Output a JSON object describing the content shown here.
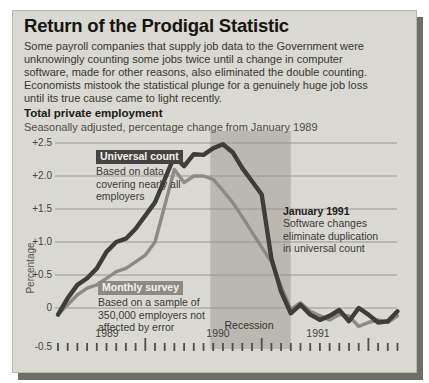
{
  "header": {
    "title": "Return of the Prodigal Statistic",
    "description": "Some payroll companies that supply job data to the Government were unknowingly counting some jobs twice until a change in computer software, made for other reasons, also eliminated the double counting. Economists mistook the statistical plunge for a genuinely huge job loss until its true cause came to light recently.",
    "chart_title": "Total private employment",
    "chart_subtitle": "Seasonally adjusted, percentage change from January 1989"
  },
  "chart_data": {
    "type": "line",
    "title": "Total private employment",
    "subtitle": "Seasonally adjusted, percentage change from January 1989",
    "ylabel": "Percentage",
    "ylim": [
      -0.5,
      2.5
    ],
    "ytick_labels": [
      "+2.5",
      "+2.0",
      "+1.5",
      "+1.0",
      "+0.5",
      "0",
      "-0.5"
    ],
    "ytick_values": [
      2.5,
      2.0,
      1.5,
      1.0,
      0.5,
      0,
      -0.5
    ],
    "grid": "horizontal only",
    "x_interval": "monthly",
    "x_years": [
      "1989",
      "1990",
      "1991"
    ],
    "months": [
      "Jan 1989",
      "Feb 1989",
      "Mar 1989",
      "Apr 1989",
      "May 1989",
      "Jun 1989",
      "Jul 1989",
      "Aug 1989",
      "Sep 1989",
      "Oct 1989",
      "Nov 1989",
      "Dec 1989",
      "Jan 1990",
      "Feb 1990",
      "Mar 1990",
      "Apr 1990",
      "May 1990",
      "Jun 1990",
      "Jul 1990",
      "Aug 1990",
      "Sep 1990",
      "Oct 1990",
      "Nov 1990",
      "Dec 1990",
      "Jan 1991",
      "Feb 1991",
      "Mar 1991",
      "Apr 1991",
      "May 1991",
      "Jun 1991",
      "Jul 1991",
      "Aug 1991",
      "Sep 1991",
      "Oct 1991",
      "Nov 1991",
      "Dec 1991"
    ],
    "tall_tick_indices": [
      9,
      21,
      32
    ],
    "series": [
      {
        "name": "Universal count",
        "description": "Based on data covering nearly all employers",
        "color": "#3e3d39",
        "values": [
          -0.1,
          0.15,
          0.35,
          0.45,
          0.6,
          0.85,
          1.0,
          1.05,
          1.2,
          1.4,
          1.6,
          1.95,
          2.3,
          2.15,
          2.33,
          2.32,
          2.42,
          2.48,
          2.36,
          2.12,
          1.92,
          1.72,
          0.75,
          0.25,
          -0.08,
          0.05,
          -0.1,
          -0.18,
          -0.12,
          -0.03,
          -0.2,
          0.0,
          -0.1,
          -0.22,
          -0.2,
          -0.05
        ]
      },
      {
        "name": "Monthly survey",
        "description": "Based on a sample of 350,000 employers not affected by error",
        "color": "#8c8a83",
        "values": [
          -0.1,
          0.05,
          0.2,
          0.3,
          0.35,
          0.45,
          0.55,
          0.6,
          0.7,
          0.8,
          1.0,
          1.55,
          2.1,
          1.9,
          2.0,
          2.0,
          1.95,
          1.78,
          1.6,
          1.38,
          1.15,
          0.92,
          0.7,
          0.33,
          -0.02,
          0.08,
          -0.05,
          -0.12,
          -0.18,
          -0.1,
          -0.12,
          -0.28,
          -0.22,
          -0.18,
          -0.22,
          -0.12
        ]
      }
    ],
    "recession_band": {
      "label": "Recession",
      "color": "#bab8b0",
      "start_month_index": 15.7,
      "end_month_index": 24
    },
    "annotations": [
      {
        "title": "January 1991",
        "text": "Software changes eliminate duplication in universal count"
      }
    ]
  }
}
